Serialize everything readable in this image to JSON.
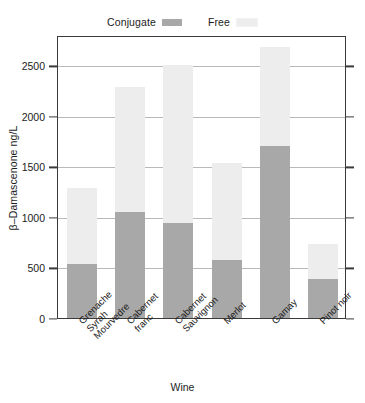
{
  "chart_data": {
    "type": "bar",
    "subtype": "stacked",
    "title": "",
    "xlabel": "Wine",
    "ylabel": "β–Damascenone ng/L",
    "categories": [
      "Grenache Syrah Mourvedre",
      "Cabernet franc",
      "Cabernet Sauvignon",
      "Merlot",
      "Gamay",
      "Pinot noir"
    ],
    "category_lines": [
      [
        "Grenache",
        "Syrah",
        "Mourvedre"
      ],
      [
        "Cabernet",
        "franc"
      ],
      [
        "Cabernet",
        "Sauvignon"
      ],
      [
        "Merlot"
      ],
      [
        "Gamay"
      ],
      [
        "Pinot noir"
      ]
    ],
    "series": [
      {
        "name": "Conjugate",
        "color": "#a8a8a8",
        "values": [
          530,
          1050,
          940,
          575,
          1700,
          385
        ]
      },
      {
        "name": "Free",
        "color": "#ededed",
        "values": [
          760,
          1235,
          1560,
          960,
          980,
          350
        ]
      }
    ],
    "totals": [
      1290,
      2285,
      2500,
      1535,
      2680,
      735
    ],
    "ylim": [
      0,
      2800
    ],
    "yticks": [
      0,
      500,
      1000,
      1500,
      2000,
      2500
    ],
    "ytick_labels": [
      "0",
      "500",
      "1000",
      "1500",
      "2000",
      "2500"
    ],
    "grid": true,
    "grid_axis": "y",
    "legend_position": "top-center",
    "legend_entries": [
      "Conjugate",
      "Free"
    ]
  },
  "legend": {
    "entries": [
      {
        "label": "Conjugate",
        "color": "#a8a8a8"
      },
      {
        "label": "Free",
        "color": "#ededed"
      }
    ]
  },
  "axes": {
    "y_title": "β–Damascenone ng/L",
    "x_title": "Wine"
  },
  "colors": {
    "conjugate": "#a8a8a8",
    "free": "#ededed",
    "frame": "#3a3a3a",
    "grid": "#b9b9b9",
    "text": "#1c1c1c",
    "background": "#ffffff"
  }
}
